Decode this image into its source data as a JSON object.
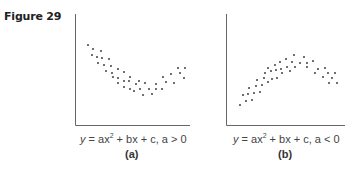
{
  "figure": {
    "title": "Figure 29"
  },
  "panels": [
    {
      "id": "a",
      "label": "(a)",
      "equation": {
        "y": "y",
        "eq1": " = ax",
        "exp": "2",
        "eq2": " + bx + c, a > 0"
      }
    },
    {
      "id": "b",
      "label": "(b)",
      "equation": {
        "y": "y",
        "eq1": " = ax",
        "exp": "2",
        "eq2": " + bx + c, a < 0"
      }
    }
  ],
  "chart_data": [
    {
      "type": "scatter",
      "title": "(a)",
      "caption": "y = ax^2 + bx + c, a > 0",
      "xlabel": "",
      "ylabel": "",
      "grid": false,
      "trend": "upward-opening parabola (U-shape)",
      "points_px": [
        [
          88,
          45
        ],
        [
          93,
          49
        ],
        [
          101,
          51
        ],
        [
          92,
          55
        ],
        [
          97,
          57
        ],
        [
          102,
          58
        ],
        [
          109,
          59
        ],
        [
          98,
          63
        ],
        [
          104,
          65
        ],
        [
          111,
          66
        ],
        [
          118,
          69
        ],
        [
          106,
          71
        ],
        [
          112,
          73
        ],
        [
          124,
          72
        ],
        [
          113,
          77
        ],
        [
          118,
          78
        ],
        [
          130,
          77
        ],
        [
          118,
          83
        ],
        [
          124,
          81
        ],
        [
          129,
          81
        ],
        [
          139,
          81
        ],
        [
          145,
          83
        ],
        [
          124,
          87
        ],
        [
          130,
          89
        ],
        [
          136,
          84
        ],
        [
          140,
          89
        ],
        [
          149,
          89
        ],
        [
          156,
          89
        ],
        [
          156,
          84
        ],
        [
          134,
          91
        ],
        [
          143,
          95
        ],
        [
          152,
          94
        ],
        [
          162,
          89
        ],
        [
          163,
          77
        ],
        [
          166,
          82
        ],
        [
          171,
          74
        ],
        [
          174,
          83
        ],
        [
          178,
          68
        ],
        [
          180,
          73
        ],
        [
          184,
          78
        ],
        [
          185,
          68
        ]
      ]
    },
    {
      "type": "scatter",
      "title": "(b)",
      "caption": "y = ax^2 + bx + c, a < 0",
      "xlabel": "",
      "ylabel": "",
      "grid": false,
      "trend": "downward-opening parabola (inverted U)",
      "points_px": [
        [
          240,
          105
        ],
        [
          246,
          101
        ],
        [
          252,
          100
        ],
        [
          243,
          95
        ],
        [
          248,
          94
        ],
        [
          254,
          93
        ],
        [
          260,
          92
        ],
        [
          249,
          88
        ],
        [
          256,
          86
        ],
        [
          262,
          85
        ],
        [
          268,
          82
        ],
        [
          257,
          80
        ],
        [
          264,
          78
        ],
        [
          272,
          79
        ],
        [
          277,
          78
        ],
        [
          282,
          73
        ],
        [
          265,
          73
        ],
        [
          271,
          71
        ],
        [
          276,
          70
        ],
        [
          268,
          68
        ],
        [
          275,
          65
        ],
        [
          281,
          69
        ],
        [
          287,
          67
        ],
        [
          290,
          71
        ],
        [
          295,
          67
        ],
        [
          280,
          62
        ],
        [
          286,
          59
        ],
        [
          292,
          62
        ],
        [
          294,
          55
        ],
        [
          300,
          63
        ],
        [
          307,
          67
        ],
        [
          304,
          57
        ],
        [
          307,
          63
        ],
        [
          313,
          61
        ],
        [
          315,
          73
        ],
        [
          318,
          69
        ],
        [
          323,
          77
        ],
        [
          325,
          68
        ],
        [
          328,
          73
        ],
        [
          332,
          78
        ],
        [
          329,
          83
        ],
        [
          335,
          73
        ],
        [
          337,
          83
        ]
      ]
    }
  ],
  "colors": {
    "axis": "#666666",
    "dot": "#333333",
    "text": "#444444"
  }
}
